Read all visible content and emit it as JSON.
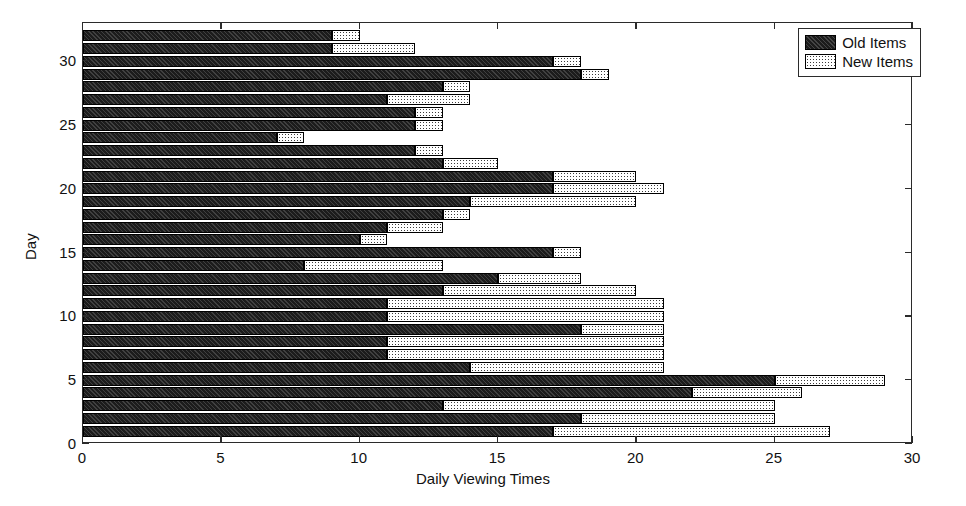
{
  "chart_data": {
    "type": "bar",
    "orientation": "horizontal",
    "stacked": true,
    "title": "",
    "xlabel": "Daily Viewing Times",
    "ylabel": "Day",
    "xlim": [
      0,
      30
    ],
    "ylim": [
      0,
      33
    ],
    "xticks": [
      0,
      5,
      10,
      15,
      20,
      25,
      30
    ],
    "yticks": [
      0,
      5,
      10,
      15,
      20,
      25,
      30
    ],
    "grid": false,
    "legend": {
      "position": "top-right",
      "entries": [
        {
          "name": "Old Items",
          "fill": "dark-hatch",
          "color": "#1c1c1c"
        },
        {
          "name": "New Items",
          "fill": "light-stipple",
          "color": "#ffffff"
        }
      ]
    },
    "categories": [
      1,
      2,
      3,
      4,
      5,
      6,
      7,
      8,
      9,
      10,
      11,
      12,
      13,
      14,
      15,
      16,
      17,
      18,
      19,
      20,
      21,
      22,
      23,
      24,
      25,
      26,
      27,
      28,
      29,
      30,
      31,
      32
    ],
    "series": [
      {
        "name": "Old Items",
        "values": [
          17,
          18,
          13,
          22,
          25,
          14,
          11,
          11,
          18,
          11,
          11,
          13,
          15,
          8,
          17,
          10,
          11,
          13,
          14,
          17,
          17,
          13,
          12,
          7,
          12,
          12,
          11,
          13,
          18,
          17,
          9,
          9
        ]
      },
      {
        "name": "New Items",
        "values": [
          10,
          7,
          12,
          4,
          4,
          7,
          10,
          10,
          3,
          10,
          10,
          7,
          3,
          5,
          1,
          1,
          2,
          1,
          6,
          4,
          3,
          2,
          1,
          1,
          1,
          1,
          3,
          1,
          1,
          1,
          3,
          1
        ]
      }
    ],
    "totals": [
      27,
      25,
      25,
      26,
      29,
      21,
      21,
      21,
      21,
      21,
      21,
      20,
      18,
      13,
      18,
      11,
      13,
      14,
      20,
      21,
      20,
      15,
      13,
      8,
      13,
      13,
      14,
      14,
      19,
      18,
      12,
      10
    ]
  },
  "axes": {
    "x_tick_labels": [
      "0",
      "5",
      "10",
      "15",
      "20",
      "25",
      "30"
    ],
    "y_tick_labels": [
      "0",
      "5",
      "10",
      "15",
      "20",
      "25",
      "30"
    ],
    "x_axis_title": "Daily Viewing Times",
    "y_axis_title": "Day"
  },
  "legend": {
    "items": [
      {
        "label": "Old Items"
      },
      {
        "label": "New Items"
      }
    ]
  }
}
